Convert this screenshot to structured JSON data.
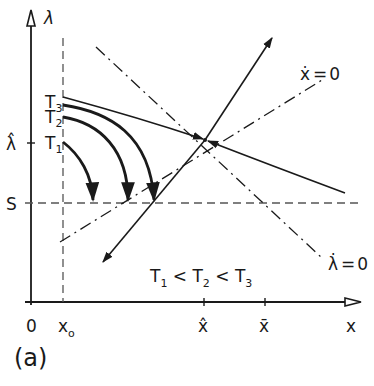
{
  "figure": {
    "panel_label": "(a)",
    "axes": {
      "y_label": "λ",
      "x_label": "x",
      "origin_label": "0",
      "x_ticks": [
        {
          "label": "x",
          "sub": "o",
          "name": "x0"
        },
        {
          "label": "x̂",
          "name": "x-hat"
        },
        {
          "label": "x̄",
          "name": "x-bar"
        }
      ],
      "y_ticks": [
        {
          "label": "λ̂",
          "name": "lambda-hat"
        },
        {
          "label": "S",
          "name": "s-level"
        }
      ]
    },
    "curves": {
      "x_dot_zero": {
        "lhs": "ẋ",
        "eq": "=",
        "rhs": "0"
      },
      "lambda_dot_zero": {
        "lhs": "λ̇",
        "eq": "=",
        "rhs": "0"
      }
    },
    "trajectory_labels": [
      {
        "T": "T",
        "sub": "3"
      },
      {
        "T": "T",
        "sub": "2"
      },
      {
        "T": "T",
        "sub": "1"
      }
    ],
    "inequality": {
      "parts": [
        "T",
        "1",
        " < ",
        "T",
        "2",
        " < ",
        "T",
        "3"
      ]
    },
    "colors": {
      "ink": "#1a1a1a",
      "dashed": "#555555",
      "background": "#ffffff"
    }
  }
}
